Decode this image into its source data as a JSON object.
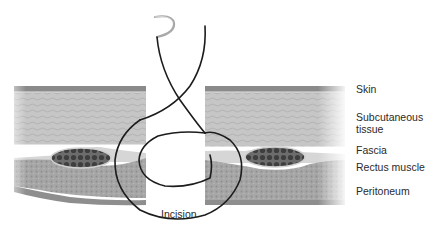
{
  "figure": {
    "type": "anatomical-diagram"
  },
  "labels": {
    "skin": "Skin",
    "subcutaneous": "Subcutaneous\ntissue",
    "fascia": "Fascia",
    "rectus": "Rectus muscle",
    "peritoneum": "Peritoneum",
    "incision": "Incision"
  },
  "colors": {
    "skin": "#8a8a8a",
    "subcutaneous": "#c4c4c4",
    "fascia": "#d8d8d8",
    "muscle": "#4a4a4a",
    "peritoneum": "#9a9a9a",
    "deep_layer": "#a8a8a8",
    "suture": "#1c1c1c",
    "needle": "#b0b0b0"
  }
}
